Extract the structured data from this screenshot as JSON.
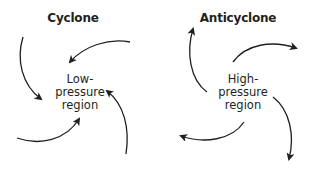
{
  "diagram": {
    "panels": [
      {
        "id": "cyclone",
        "title": "Cyclone",
        "center_label": [
          "Low-",
          "pressure",
          "region"
        ],
        "flow": "inward",
        "arrow_count": 4
      },
      {
        "id": "anticyclone",
        "title": "Anticyclone",
        "center_label": [
          "High-",
          "pressure",
          "region"
        ],
        "flow": "outward",
        "arrow_count": 4
      }
    ],
    "colors": {
      "background": "#ffffff",
      "ink": "#231f20"
    }
  }
}
